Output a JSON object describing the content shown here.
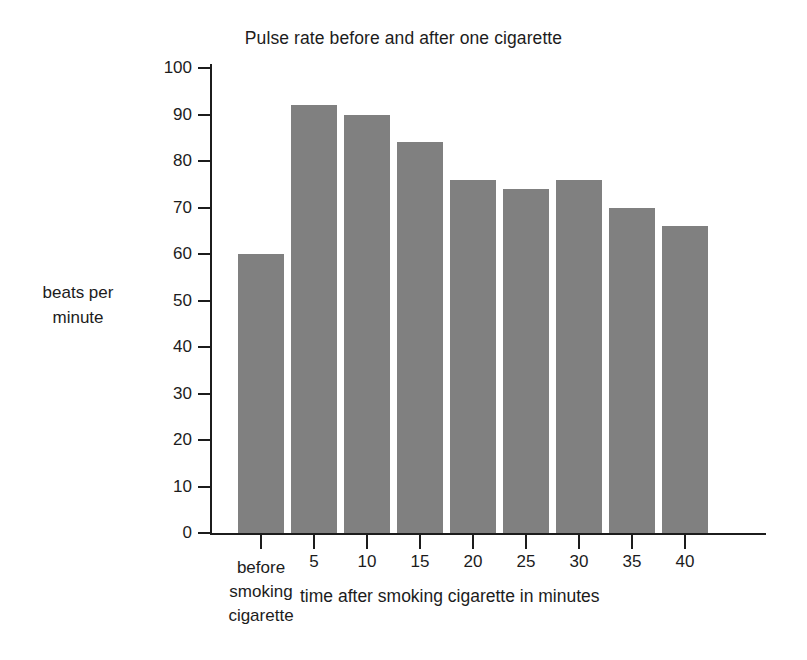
{
  "chart_data": {
    "type": "bar",
    "title": "Pulse rate before and after one cigarette",
    "xlabel": "time after smoking cigarette in minutes",
    "ylabel": "beats per minute",
    "ylabel_lines": [
      "beats per",
      "minute"
    ],
    "categories": [
      "before smoking cigarette",
      "5",
      "10",
      "15",
      "20",
      "25",
      "30",
      "35",
      "40"
    ],
    "category_lines": [
      [
        "before",
        "smoking",
        "cigarette"
      ],
      [
        "5"
      ],
      [
        "10"
      ],
      [
        "15"
      ],
      [
        "20"
      ],
      [
        "25"
      ],
      [
        "30"
      ],
      [
        "35"
      ],
      [
        "40"
      ]
    ],
    "values": [
      60,
      92,
      90,
      84,
      76,
      74,
      76,
      70,
      66
    ],
    "ylim": [
      0,
      100
    ],
    "ytick_values": [
      0,
      10,
      20,
      30,
      40,
      50,
      60,
      70,
      80,
      90,
      100
    ],
    "ytick_labels": [
      "0",
      "10",
      "20",
      "30",
      "40",
      "50",
      "60",
      "70",
      "80",
      "90",
      "100"
    ],
    "grid": false,
    "legend": null,
    "bar_color": "#808080",
    "axis_color": "#1c1c1c",
    "background_color": "#ffffff"
  }
}
